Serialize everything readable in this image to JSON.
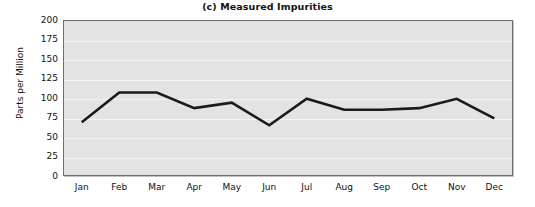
{
  "chart_data": {
    "type": "line",
    "title": "(c) Measured Impurities",
    "xlabel": "",
    "ylabel": "Parts per Million",
    "categories": [
      "Jan",
      "Feb",
      "Mar",
      "Apr",
      "May",
      "Jun",
      "Jul",
      "Aug",
      "Sep",
      "Oct",
      "Nov",
      "Dec"
    ],
    "series": [
      {
        "name": "Measured Impurities",
        "values": [
          69,
          107,
          107,
          87,
          94,
          65,
          99,
          85,
          85,
          87,
          99,
          74
        ],
        "color": "#1a1a1a"
      }
    ],
    "ylim": [
      0,
      200
    ],
    "yticks": [
      0,
      25,
      50,
      75,
      100,
      125,
      150,
      175,
      200
    ],
    "ytick_labels": [
      "0",
      "25",
      "50",
      "75",
      "100",
      "125",
      "150",
      "175",
      "200"
    ],
    "grid": "horizontal",
    "gridcolor": "#f3f3f3",
    "plot_background": "#e3e3e3",
    "legend": "none",
    "line_width": 2.6
  }
}
